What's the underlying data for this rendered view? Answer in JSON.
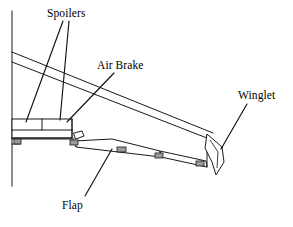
{
  "figure": {
    "type": "line-drawing",
    "background_color": "#ffffff",
    "line_color": "#1a1a1a",
    "fairing_color": "#9a9a9a",
    "view": "planform / top view of port wing with fuselage at left"
  },
  "labels": {
    "spoilers": "Spoilers",
    "air_brake": "Air Brake",
    "winglet": "Winglet",
    "flap": "Flap"
  },
  "annotations": [
    {
      "id": "spoilers",
      "text": "Spoilers",
      "text_x": 47,
      "text_y": 7,
      "leaders": [
        {
          "x1": 63,
          "y1": 21,
          "x2": 26,
          "y2": 122
        },
        {
          "x1": 69,
          "y1": 21,
          "x2": 60,
          "y2": 120
        }
      ]
    },
    {
      "id": "air-brake",
      "text": "Air Brake",
      "text_x": 97,
      "text_y": 59,
      "leaders": [
        {
          "x1": 114,
          "y1": 73,
          "x2": 67,
          "y2": 122
        }
      ]
    },
    {
      "id": "winglet",
      "text": "Winglet",
      "text_x": 238,
      "text_y": 89,
      "leaders": [
        {
          "x1": 247,
          "y1": 104,
          "x2": 221,
          "y2": 149
        }
      ]
    },
    {
      "id": "flap",
      "text": "Flap",
      "text_x": 62,
      "text_y": 199,
      "leaders": [
        {
          "x1": 112,
          "y1": 149,
          "x2": 85,
          "y2": 196
        }
      ]
    }
  ],
  "geometry": {
    "fuselage_line": {
      "x": 12,
      "y1": 11,
      "y2": 186
    },
    "leading_edge_upper": {
      "x1": 12,
      "y1": 52,
      "x2": 213,
      "y2": 133
    },
    "leading_edge_lower": {
      "x1": 12,
      "y1": 62,
      "x2": 212,
      "y2": 140
    },
    "trailing_edge_root": {
      "x1": 12,
      "y1": 139,
      "x2": 72,
      "y2": 139
    },
    "spoiler_box": {
      "x": 12,
      "y": 119,
      "width": 60,
      "height": 19,
      "divider_x": 42,
      "band_y": 130
    },
    "flap_panel": {
      "points": "72,141 110,139 158,150 160,156 74,147"
    },
    "aileron_panel": {
      "points": "158,150 205,160 206,166 160,156"
    },
    "winglet": {
      "points": "206,133 222,146 224,160 216,172 210,160 204,146"
    },
    "fairings": [
      {
        "x": 14,
        "y": 139,
        "w": 7,
        "h": 5
      },
      {
        "x": 70,
        "y": 140,
        "w": 8,
        "h": 5
      },
      {
        "x": 117,
        "y": 147,
        "w": 9,
        "h": 5
      },
      {
        "x": 155,
        "y": 153,
        "w": 8,
        "h": 5
      },
      {
        "x": 196,
        "y": 161,
        "w": 8,
        "h": 5
      }
    ]
  }
}
